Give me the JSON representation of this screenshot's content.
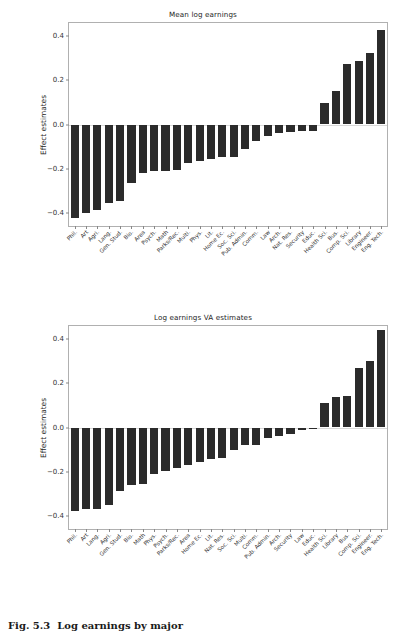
{
  "figure": {
    "caption_number": "Fig. 5.3",
    "caption_text": "Log earnings by major"
  },
  "axis": {
    "ylabel": "Effect estimates",
    "yticks": [
      "0.4",
      "0.2",
      "0.0",
      "−0.2",
      "−0.4"
    ],
    "ytick_values": [
      0.4,
      0.2,
      0.0,
      -0.2,
      -0.4
    ]
  },
  "chart_data": [
    {
      "type": "bar",
      "title": "Mean log earnings",
      "xlabel": "",
      "ylabel": "Effect estimates",
      "ylim": [
        -0.46,
        0.46
      ],
      "yticks": [
        0.4,
        0.2,
        0.0,
        -0.2,
        -0.4
      ],
      "grid": false,
      "legend": "none",
      "bar_color": "#2b2b2b",
      "categories": [
        "Phil.",
        "Art",
        "Agri.",
        "Lang.",
        "Gen. Stud.",
        "Bio.",
        "Area",
        "Psych.",
        "Math",
        "Parks/Rec.",
        "Multi.",
        "Phys.",
        "Lit.",
        "Home Ec.",
        "Soc. Sci.",
        "Pub. Admin.",
        "Comm.",
        "Law",
        "Arch.",
        "Nat. Res.",
        "Security",
        "Educ.",
        "Health Sci.",
        "Bus.",
        "Comp. Sci.",
        "Library",
        "Engineer.",
        "Eng. Tech."
      ],
      "values": [
        -0.423,
        -0.4,
        -0.388,
        -0.358,
        -0.345,
        -0.265,
        -0.222,
        -0.21,
        -0.212,
        -0.206,
        -0.175,
        -0.165,
        -0.155,
        -0.148,
        -0.148,
        -0.113,
        -0.075,
        -0.053,
        -0.04,
        -0.035,
        -0.03,
        -0.03,
        0.097,
        0.153,
        0.275,
        0.29,
        0.325,
        0.428
      ]
    },
    {
      "type": "bar",
      "title": "Log earnings VA estimates",
      "xlabel": "",
      "ylabel": "Effect estimates",
      "ylim": [
        -0.46,
        0.46
      ],
      "yticks": [
        0.4,
        0.2,
        0.0,
        -0.2,
        -0.4
      ],
      "grid": false,
      "legend": "none",
      "bar_color": "#2b2b2b",
      "categories": [
        "Phil.",
        "Art",
        "Lang.",
        "Agri.",
        "Gen. Stud.",
        "Bio.",
        "Math",
        "Phys.",
        "Psych.",
        "Parks/Rec.",
        "Area",
        "Home Ec.",
        "Lit.",
        "Nat. Res.",
        "Soc. Sci.",
        "Multi.",
        "Comm.",
        "Pub. Admin.",
        "Arch.",
        "Security",
        "Law",
        "Educ.",
        "Health Sci.",
        "Library",
        "Bus.",
        "Comp. Sci.",
        "Engineer.",
        "Eng. Tech."
      ],
      "values": [
        -0.378,
        -0.37,
        -0.368,
        -0.35,
        -0.29,
        -0.262,
        -0.258,
        -0.212,
        -0.196,
        -0.182,
        -0.17,
        -0.155,
        -0.142,
        -0.138,
        -0.103,
        -0.08,
        -0.078,
        -0.048,
        -0.038,
        -0.03,
        -0.01,
        -0.004,
        0.11,
        0.138,
        0.142,
        0.268,
        0.302,
        0.44
      ]
    }
  ]
}
